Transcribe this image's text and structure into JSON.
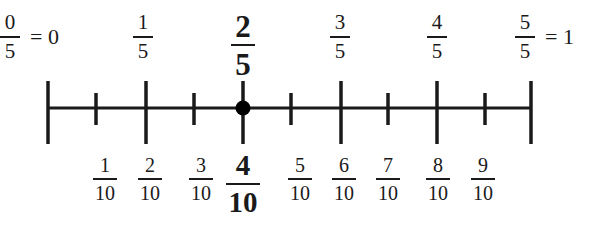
{
  "diagram": {
    "line": {
      "y": 108,
      "x_start": 48,
      "x_end": 531,
      "color": "#1a1a1a"
    },
    "highlight_point": {
      "x": 243,
      "value": "2/5 = 4/10",
      "color": "#000000"
    },
    "top_labels": [
      {
        "num": "0",
        "den": "5",
        "suffix": "= 0",
        "x": 10,
        "bold": false
      },
      {
        "num": "1",
        "den": "5",
        "x": 143,
        "bold": false
      },
      {
        "num": "2",
        "den": "5",
        "x": 243,
        "bold": true
      },
      {
        "num": "3",
        "den": "5",
        "x": 340,
        "bold": false
      },
      {
        "num": "4",
        "den": "5",
        "x": 437,
        "bold": false
      },
      {
        "num": "5",
        "den": "5",
        "suffix": "= 1",
        "x": 525,
        "bold": false
      }
    ],
    "bottom_labels": [
      {
        "num": "1",
        "den": "10",
        "x": 105,
        "bold": false
      },
      {
        "num": "2",
        "den": "10",
        "x": 150,
        "bold": false
      },
      {
        "num": "3",
        "den": "10",
        "x": 201,
        "bold": false
      },
      {
        "num": "4",
        "den": "10",
        "x": 243,
        "bold": true
      },
      {
        "num": "5",
        "den": "10",
        "x": 300,
        "bold": false
      },
      {
        "num": "6",
        "den": "10",
        "x": 344,
        "bold": false
      },
      {
        "num": "7",
        "den": "10",
        "x": 388,
        "bold": false
      },
      {
        "num": "8",
        "den": "10",
        "x": 438,
        "bold": false
      },
      {
        "num": "9",
        "den": "10",
        "x": 483,
        "bold": false
      }
    ],
    "long_ticks_x": [
      48,
      146,
      243,
      341,
      437,
      531
    ],
    "short_ticks_x": [
      96,
      194,
      291,
      388,
      485
    ]
  }
}
